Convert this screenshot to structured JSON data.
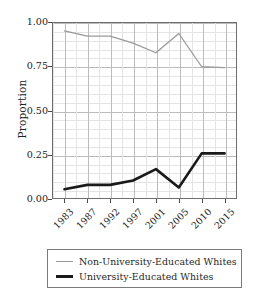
{
  "figure": {
    "background_color": "#ffffff",
    "frame_color": "#6e6e6e"
  },
  "chart_data": {
    "type": "line",
    "title": "",
    "xlabel": "",
    "ylabel": "Proportion",
    "categories": [
      "1983",
      "1987",
      "1992",
      "1997",
      "2001",
      "2005",
      "2010",
      "2015"
    ],
    "x": [
      1983,
      1987,
      1992,
      1997,
      2001,
      2005,
      2010,
      2015
    ],
    "ylim": [
      0.0,
      1.0
    ],
    "yticks": [
      "0.00",
      "0.25",
      "0.50",
      "0.75",
      "1.00"
    ],
    "ytick_values": [
      0.0,
      0.25,
      0.5,
      0.75,
      1.0
    ],
    "grid": true,
    "grid_minor": true,
    "legend_position": "below",
    "series": [
      {
        "name": "Non-University-Educated Whites",
        "color": "#9a9a9a",
        "line_width": 1.3,
        "values": [
          0.955,
          0.925,
          0.925,
          0.885,
          0.83,
          0.94,
          0.75,
          0.745
        ]
      },
      {
        "name": "University-Educated Whites",
        "color": "#1a1a1a",
        "line_width": 2.6,
        "values": [
          0.05,
          0.075,
          0.075,
          0.1,
          0.165,
          0.06,
          0.255,
          0.255
        ]
      }
    ]
  },
  "legend": {
    "entries": [
      {
        "label": "Non-University-Educated Whites",
        "swatch": "thin-gray-line"
      },
      {
        "label": "University-Educated Whites",
        "swatch": "thick-black-line"
      }
    ]
  }
}
